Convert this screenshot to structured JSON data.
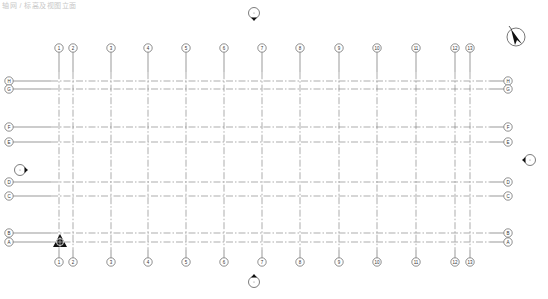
{
  "caption": "轴网 / 标高及视图立面",
  "drawing": {
    "type": "structural-grid-plan",
    "line_color": "#555555",
    "grid_line_color": "#777777",
    "bubble_radius": 4.2,
    "columns": [
      {
        "label": "1",
        "x": 59
      },
      {
        "label": "2",
        "x": 73
      },
      {
        "label": "3",
        "x": 111
      },
      {
        "label": "4",
        "x": 148
      },
      {
        "label": "5",
        "x": 186
      },
      {
        "label": "6",
        "x": 224
      },
      {
        "label": "7",
        "x": 262
      },
      {
        "label": "8",
        "x": 300
      },
      {
        "label": "9",
        "x": 339
      },
      {
        "label": "10",
        "x": 377
      },
      {
        "label": "11",
        "x": 416
      },
      {
        "label": "12",
        "x": 455
      },
      {
        "label": "13",
        "x": 470
      }
    ],
    "column_bubbles_top_y": 48,
    "column_bubbles_bottom_y": 262,
    "rows": [
      {
        "label": "H",
        "y": 81
      },
      {
        "label": "G",
        "y": 89
      },
      {
        "label": "F",
        "y": 127
      },
      {
        "label": "E",
        "y": 142
      },
      {
        "label": "D",
        "y": 182
      },
      {
        "label": "C",
        "y": 196
      },
      {
        "label": "B",
        "y": 233
      },
      {
        "label": "A",
        "y": 242
      }
    ],
    "row_bubbles_left_x": 9,
    "row_bubbles_right_x": 508,
    "elevation_markers": [
      {
        "name": "north",
        "x": 254,
        "y": 13,
        "dir": "down"
      },
      {
        "name": "south",
        "x": 254,
        "y": 282,
        "dir": "up"
      },
      {
        "name": "west",
        "x": 20,
        "y": 170,
        "dir": "right"
      },
      {
        "name": "east",
        "x": 530,
        "y": 160,
        "dir": "left"
      }
    ],
    "north_arrow": {
      "x": 516,
      "y": 37,
      "r": 9
    },
    "survey_point": {
      "x": 60,
      "y": 242
    }
  }
}
